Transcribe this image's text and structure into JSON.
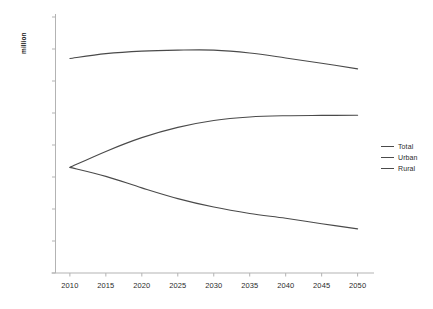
{
  "chart_data": {
    "type": "line",
    "title": "",
    "xlabel": "",
    "ylabel": "million",
    "x": [
      2010,
      2015,
      2020,
      2025,
      2030,
      2035,
      2040,
      2045,
      2050
    ],
    "xlim": [
      2008,
      2052
    ],
    "ylim": [
      0,
      1600
    ],
    "ytick_labels": [
      "-",
      "200",
      "400",
      "600",
      "800",
      "1,000",
      "1,200",
      "1,400",
      "1,600"
    ],
    "yticks": [
      0,
      200,
      400,
      600,
      800,
      1000,
      1200,
      1400,
      1600
    ],
    "xtick_labels": [
      "2010",
      "2015",
      "2020",
      "2025",
      "2030",
      "2035",
      "2040",
      "2045",
      "2050"
    ],
    "grid": false,
    "legend_position": "right",
    "series": [
      {
        "name": "Total",
        "color": "#4a4a4a",
        "values": [
          1341,
          1371,
          1387,
          1393,
          1393,
          1375,
          1344,
          1311,
          1276
        ]
      },
      {
        "name": "Urban",
        "color": "#4a4a4a",
        "values": [
          660,
          760,
          846,
          910,
          953,
          975,
          983,
          985,
          986
        ]
      },
      {
        "name": "Rural",
        "color": "#4a4a4a",
        "values": [
          660,
          604,
          532,
          465,
          412,
          372,
          342,
          308,
          276
        ]
      }
    ]
  },
  "legend": {
    "items": [
      {
        "label": "Total"
      },
      {
        "label": "Urban"
      },
      {
        "label": "Rural"
      }
    ]
  },
  "colors": {
    "axis": "#b3b3b3",
    "line": "#4a4a4a",
    "text": "#2b2b2b",
    "background": "#ffffff"
  }
}
